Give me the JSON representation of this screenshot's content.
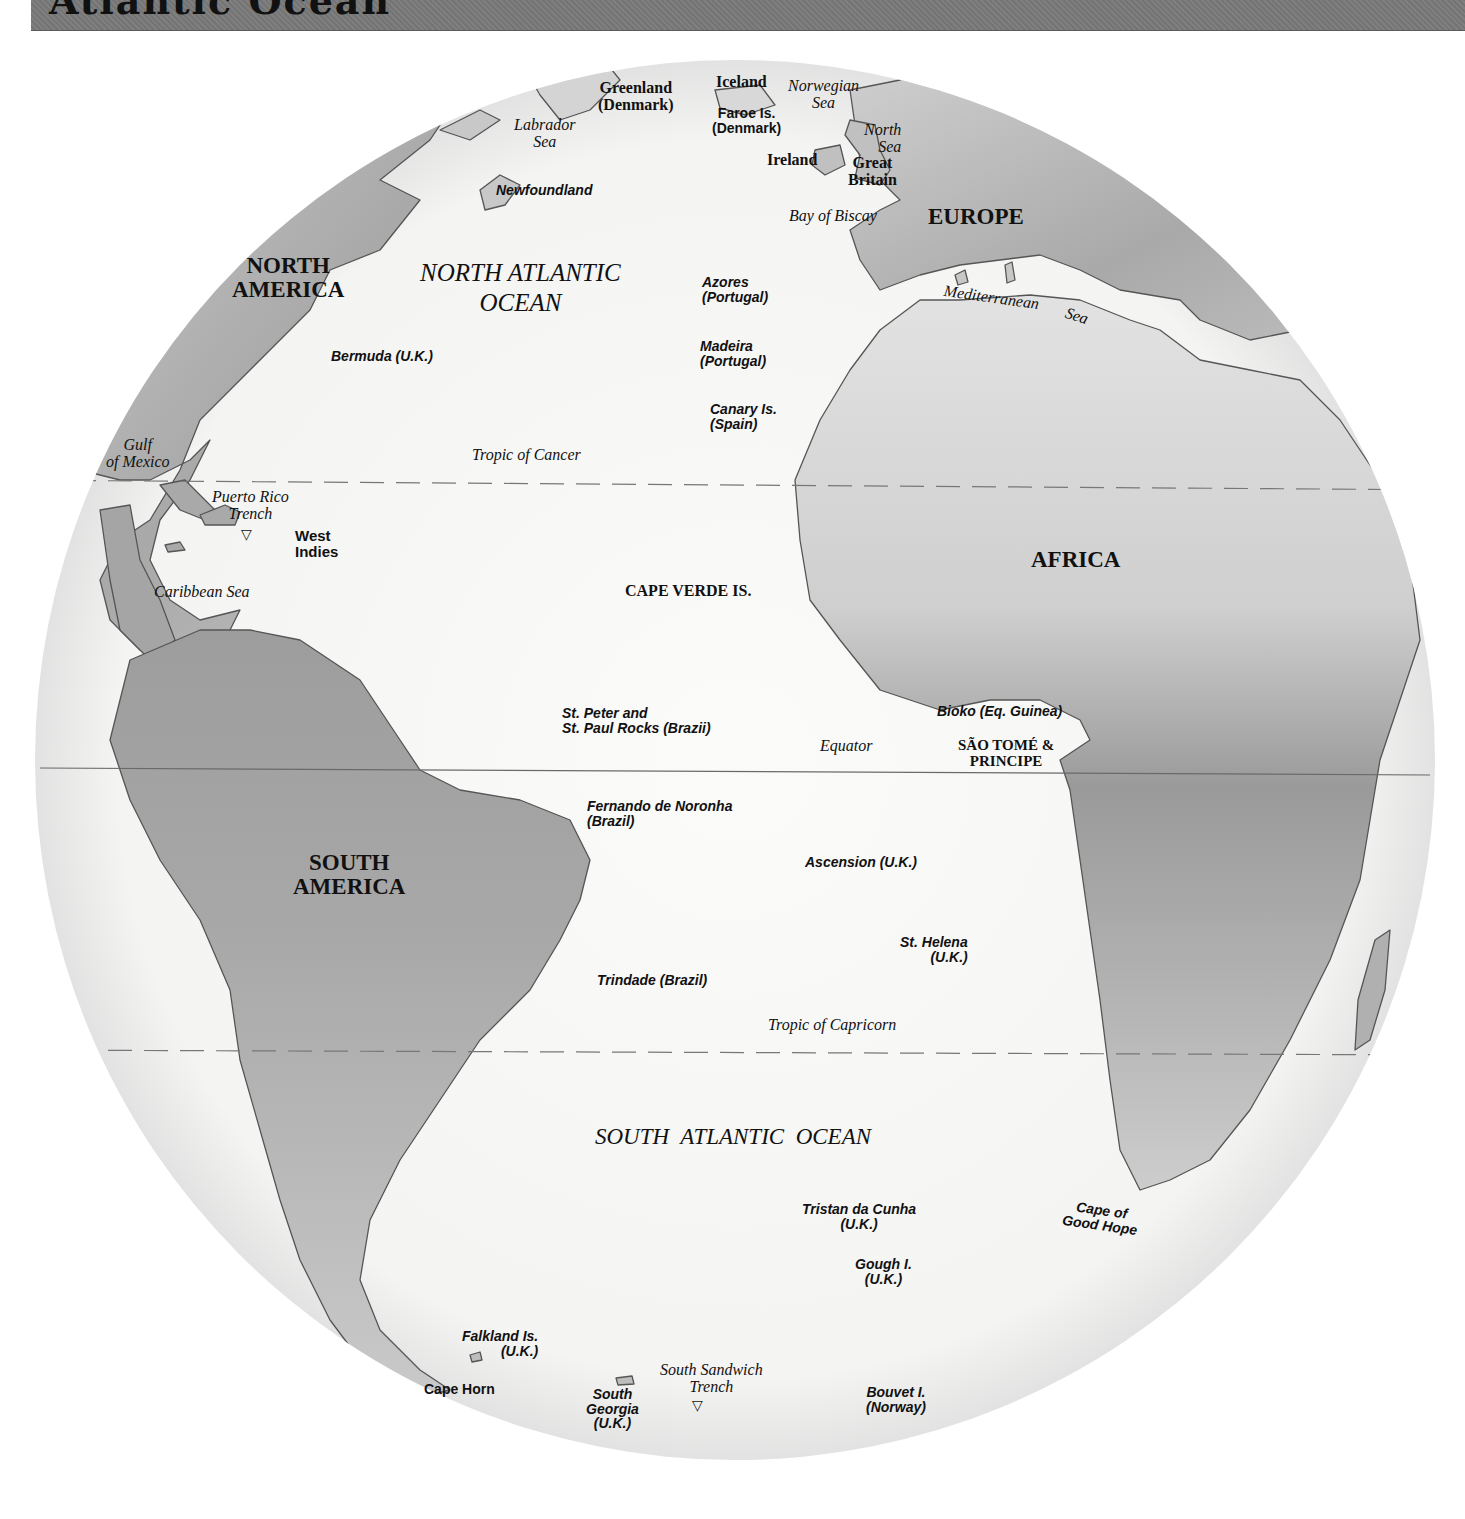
{
  "header": {
    "title": "Atlantic Ocean",
    "bar_color": "#7a7a7a"
  },
  "map": {
    "colors": {
      "ocean": "#f7f7f6",
      "land": "#bdbdbd",
      "land_dark": "#8e8e8e",
      "coast": "#555555",
      "equator": "#6a6a6a",
      "tropic": "#777777"
    },
    "lines": {
      "equator": "Equator",
      "tropic_cancer": "Tropic of Cancer",
      "tropic_capricorn": "Tropic of Capricorn"
    },
    "continents": {
      "north_america": "NORTH\nAMERICA",
      "south_america": "SOUTH\nAMERICA",
      "europe": "EUROPE",
      "africa": "AFRICA"
    },
    "oceans": {
      "north_atlantic": "NORTH ATLANTIC\nOCEAN",
      "south_atlantic": "SOUTH  ATLANTIC  OCEAN"
    },
    "seas": {
      "labrador": "Labrador\nSea",
      "norwegian": "Norwegian\nSea",
      "north": "North\nSea",
      "biscay": "Bay of Biscay",
      "mediterranean": "Mediterranean",
      "mediterranean_sea": "Sea",
      "gulf_mexico": "Gulf\nof Mexico",
      "caribbean": "Caribbean Sea"
    },
    "trenches": {
      "puerto_rico": "Puerto Rico\nTrench",
      "south_sandwich": "South Sandwich\nTrench",
      "marker": "▽"
    },
    "countries": {
      "greenland": "Greenland\n(Denmark)",
      "iceland": "Iceland",
      "ireland": "Ireland",
      "great_britain": "Great\nBritain",
      "cape_verde": "CAPE VERDE IS.",
      "sao_tome": "SÃO TOMÉ &\nPRINCIPE"
    },
    "places": {
      "faroe": "Faroe Is.\n(Denmark)",
      "newfoundland": "Newfoundland",
      "bermuda": "Bermuda (U.K.)",
      "azores": "Azores\n(Portugal)",
      "madeira": "Madeira\n(Portugal)",
      "canary": "Canary Is.\n(Spain)",
      "west_indies": "West\nIndies",
      "st_peter_paul": "St. Peter and\nSt. Paul Rocks (Brazii)",
      "bioko": "Bioko (Eq. Guinea)",
      "fernando": "Fernando de Noronha\n(Brazil)",
      "ascension": "Ascension (U.K.)",
      "st_helena": "St. Helena\n(U.K.)",
      "trindade": "Trindade (Brazil)",
      "tristan": "Tristan da Cunha\n(U.K.)",
      "gough": "Gough I.\n(U.K.)",
      "cape_good_hope": "Cape of\nGood Hope",
      "falkland": "Falkland Is.\n(U.K.)",
      "cape_horn": "Cape Horn",
      "south_georgia": "South\nGeorgia\n(U.K.)",
      "bouvet": "Bouvet I.\n(Norway)"
    }
  }
}
